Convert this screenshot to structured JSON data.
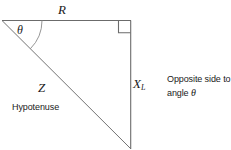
{
  "figure": {
    "type": "right-triangle-impedance-diagram",
    "background_color": "#ffffff",
    "stroke_color": "#555555",
    "text_color": "#1a1a1a",
    "width": 231,
    "height": 149
  },
  "geometry": {
    "apex_vertex": [
      2,
      20
    ],
    "right_angle_vertex": [
      131,
      21
    ],
    "bottom_vertex": [
      131,
      149
    ],
    "right_angle_marker": {
      "x": 118,
      "y": 21,
      "size": 12
    },
    "angle_arc_radius": 40
  },
  "labels": {
    "adjacent_side": "R",
    "angle": "θ",
    "hypotenuse_symbol": "Z",
    "opposite_side_symbol": "X",
    "opposite_side_subscript": "L",
    "hypotenuse_caption": "Hypotenuse"
  },
  "note": {
    "line1": "Opposite side to",
    "line2_prefix": "angle ",
    "line2_symbol": "θ"
  }
}
